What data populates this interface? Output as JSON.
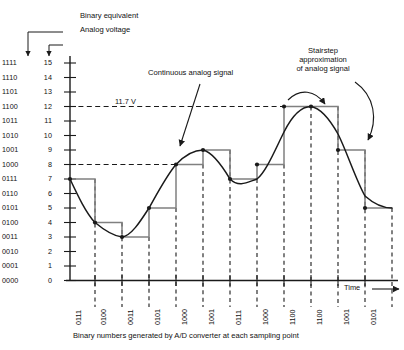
{
  "figure": {
    "title_caption": "Binary numbers generated by A/D converter at each sampling point",
    "annotations": {
      "binary_equivalent": "Binary equivalent",
      "analog_voltage": "Analog voltage",
      "continuous_signal": "Continuous analog signal",
      "stairstep_line1": "Stairstep",
      "stairstep_line2": "approximation",
      "stairstep_line3": "of analog signal",
      "voltage_marker": "11.7 V",
      "time_axis": "Time"
    },
    "colors": {
      "curve": "#1a1a1a",
      "stairstep": "#808080",
      "axis": "#1a1a1a",
      "dashed": "#1a1a1a",
      "text": "#111111"
    }
  },
  "chart_data": {
    "type": "line",
    "title": "",
    "xlabel": "Time",
    "ylabel": "",
    "ylim": [
      0,
      15
    ],
    "grid": false,
    "legend": "none",
    "y_axis": {
      "decimal_ticks": [
        15,
        14,
        13,
        12,
        11,
        10,
        9,
        8,
        7,
        6,
        5,
        4,
        3,
        2,
        1,
        0
      ],
      "binary_ticks": [
        "1111",
        "1110",
        "1101",
        "1100",
        "1011",
        "1010",
        "1001",
        "1000",
        "0111",
        "0110",
        "0101",
        "0100",
        "0011",
        "0010",
        "0001",
        "0000"
      ]
    },
    "reference_lines": [
      {
        "level": 12,
        "label": "11.7 V",
        "style": "dashed"
      },
      {
        "level": 8,
        "label": "",
        "style": "dashed"
      }
    ],
    "sample_count": 12,
    "samples": [
      {
        "index": 1,
        "binary": "0111",
        "value": 7
      },
      {
        "index": 2,
        "binary": "0100",
        "value": 4
      },
      {
        "index": 3,
        "binary": "0011",
        "value": 3
      },
      {
        "index": 4,
        "binary": "0101",
        "value": 5
      },
      {
        "index": 5,
        "binary": "1000",
        "value": 8
      },
      {
        "index": 6,
        "binary": "1001",
        "value": 9
      },
      {
        "index": 7,
        "binary": "0111",
        "value": 7
      },
      {
        "index": 8,
        "binary": "1000",
        "value": 8
      },
      {
        "index": 9,
        "binary": "1100",
        "value": 12
      },
      {
        "index": 10,
        "binary": "1100",
        "value": 12
      },
      {
        "index": 11,
        "binary": "1001",
        "value": 9
      },
      {
        "index": 12,
        "binary": "0101",
        "value": 5
      }
    ],
    "series": [
      {
        "name": "Continuous analog signal",
        "style": "smooth-curve",
        "values": [
          7,
          4,
          3,
          5,
          8,
          9,
          7,
          8,
          12,
          12,
          9,
          5
        ]
      },
      {
        "name": "Stairstep approximation",
        "style": "step",
        "values": [
          7,
          4,
          3,
          5,
          8,
          9,
          7,
          8,
          12,
          12,
          9,
          5
        ]
      }
    ]
  }
}
